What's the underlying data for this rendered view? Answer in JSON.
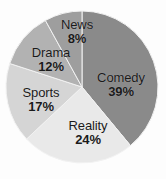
{
  "chart_data": {
    "type": "pie",
    "title": "",
    "subtitle": "",
    "xlabel": "",
    "ylabel": "",
    "legend_position": "none",
    "grid": false,
    "labels_inside": true,
    "start_angle_deg": 0,
    "direction": "clockwise",
    "center": {
      "x": 82,
      "y": 87
    },
    "radius": 76,
    "categories": [
      "Comedy",
      "Reality",
      "Sports",
      "Drama",
      "News"
    ],
    "values": [
      39,
      24,
      17,
      12,
      8
    ],
    "value_suffix": "%",
    "total": 100,
    "colors": [
      "#8a8a8a",
      "#e9e9e9",
      "#d5d5d5",
      "#b2b2b2",
      "#9e9e9e"
    ],
    "slices": [
      {
        "name": "Comedy",
        "value": 39,
        "value_label": "39%",
        "color": "#8a8a8a",
        "start_deg": 0,
        "sweep_deg": 140.4,
        "label_x": 121,
        "label_y": 85
      },
      {
        "name": "Reality",
        "value": 24,
        "value_label": "24%",
        "color": "#e9e9e9",
        "start_deg": 140.4,
        "sweep_deg": 86.4,
        "label_x": 88,
        "label_y": 133
      },
      {
        "name": "Sports",
        "value": 17,
        "value_label": "17%",
        "color": "#d5d5d5",
        "start_deg": 226.8,
        "sweep_deg": 61.2,
        "label_x": 41,
        "label_y": 100
      },
      {
        "name": "Drama",
        "value": 12,
        "value_label": "12%",
        "color": "#b2b2b2",
        "start_deg": 288.0,
        "sweep_deg": 43.2,
        "label_x": 51,
        "label_y": 60
      },
      {
        "name": "News",
        "value": 8,
        "value_label": "8%",
        "color": "#9e9e9e",
        "start_deg": 331.2,
        "sweep_deg": 28.8,
        "label_x": 77,
        "label_y": 32
      }
    ],
    "background_color": "#fdfdfd",
    "label_text_color": "#1a1a1a"
  }
}
